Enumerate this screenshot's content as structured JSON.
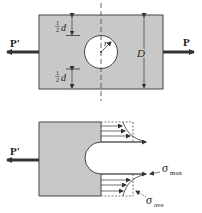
{
  "figure": {
    "top": {
      "load_left_label": "P'",
      "load_right_label": "P",
      "half_d_top_label_num": "1",
      "half_d_top_label_den": "2",
      "half_d_top_label_var": "d",
      "half_d_bottom_label_num": "1",
      "half_d_bottom_label_den": "2",
      "half_d_bottom_label_var": "d",
      "radius_label": "r",
      "width_label": "D"
    },
    "bottom": {
      "load_left_label": "P'",
      "sigma_max_symbol": "σ",
      "sigma_max_sub": "max",
      "sigma_ave_symbol": "σ",
      "sigma_ave_sub": "ave"
    },
    "colors": {
      "plate_fill": "#c8c8c8",
      "line": "#333333",
      "background": "#ffffff"
    }
  }
}
